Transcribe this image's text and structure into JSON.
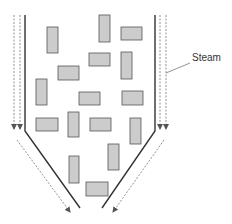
{
  "diagram": {
    "label": "Steam",
    "colors": {
      "wall": "#333333",
      "steam_arrow": "#777777",
      "particle_fill": "#cccccc",
      "particle_stroke": "#555555"
    },
    "walls": {
      "left": [
        [
          25,
          15
        ],
        [
          25,
          131
        ],
        [
          80,
          208
        ]
      ],
      "right": [
        [
          155,
          15
        ],
        [
          155,
          131
        ],
        [
          102,
          208
        ]
      ]
    },
    "steam_arrows": [
      {
        "x1": 14,
        "y1": 15,
        "x2": 14,
        "y2": 129
      },
      {
        "x1": 20,
        "y1": 15,
        "x2": 20,
        "y2": 129
      },
      {
        "x1": 160,
        "y1": 15,
        "x2": 160,
        "y2": 129
      },
      {
        "x1": 166,
        "y1": 15,
        "x2": 166,
        "y2": 129
      },
      {
        "x1": 17,
        "y1": 140,
        "x2": 70,
        "y2": 212
      },
      {
        "x1": 164,
        "y1": 140,
        "x2": 113,
        "y2": 212
      }
    ],
    "particles": [
      {
        "x": 47,
        "y": 27,
        "w": 11,
        "h": 26
      },
      {
        "x": 99,
        "y": 15,
        "w": 11,
        "h": 27
      },
      {
        "x": 121,
        "y": 27,
        "w": 21,
        "h": 13
      },
      {
        "x": 89,
        "y": 53,
        "w": 21,
        "h": 13
      },
      {
        "x": 121,
        "y": 52,
        "w": 11,
        "h": 27
      },
      {
        "x": 58,
        "y": 66,
        "w": 21,
        "h": 14
      },
      {
        "x": 36,
        "y": 79,
        "w": 11,
        "h": 26
      },
      {
        "x": 79,
        "y": 92,
        "w": 21,
        "h": 13
      },
      {
        "x": 122,
        "y": 91,
        "w": 21,
        "h": 14
      },
      {
        "x": 36,
        "y": 118,
        "w": 22,
        "h": 13
      },
      {
        "x": 68,
        "y": 112,
        "w": 11,
        "h": 25
      },
      {
        "x": 90,
        "y": 118,
        "w": 21,
        "h": 13
      },
      {
        "x": 130,
        "y": 118,
        "w": 11,
        "h": 26
      },
      {
        "x": 108,
        "y": 144,
        "w": 11,
        "h": 26
      },
      {
        "x": 69,
        "y": 156,
        "w": 10,
        "h": 27
      },
      {
        "x": 86,
        "y": 182,
        "w": 22,
        "h": 14
      }
    ],
    "leader": {
      "x1": 166,
      "y1": 73,
      "x2": 190,
      "y2": 63
    }
  }
}
